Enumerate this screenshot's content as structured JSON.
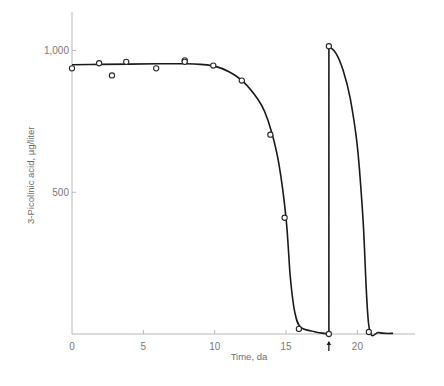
{
  "chart_data": {
    "type": "scatter",
    "title": "",
    "xlabel": "Time, da",
    "ylabel": "3-Picolinic acid, µg/liter",
    "xlim": [
      0,
      24
    ],
    "ylim": [
      0,
      1150
    ],
    "grid": false,
    "legend": null,
    "x_ticks": [
      0,
      5,
      10,
      15,
      20
    ],
    "x_tick_labels": [
      "0",
      "5",
      "10",
      "15",
      "20"
    ],
    "y_ticks": [
      500,
      1000
    ],
    "y_tick_labels": [
      "500",
      "1,000"
    ],
    "series": [
      {
        "name": "observed",
        "style": "open-circle",
        "x": [
          0,
          1.9,
          2.8,
          3.8,
          5.9,
          7.9,
          7.9,
          9.9,
          11.9,
          13.9,
          14.9,
          15.9,
          18.0,
          18.0,
          20.8
        ],
        "y": [
          937,
          955,
          912,
          960,
          937,
          965,
          960,
          947,
          894,
          703,
          410,
          18,
          0,
          1015,
          7
        ]
      },
      {
        "name": "fitted curve",
        "style": "line",
        "x": [
          0,
          2,
          4,
          6,
          8,
          9,
          10,
          11,
          12,
          13,
          13.5,
          14,
          14.5,
          15,
          15.3,
          15.6,
          16,
          17,
          18,
          18,
          18.5,
          19,
          19.5,
          20,
          20.4,
          20.8,
          21.5,
          22.5
        ],
        "y": [
          950,
          951,
          952,
          953,
          953,
          951,
          945,
          925,
          890,
          830,
          785,
          710,
          600,
          410,
          200,
          80,
          25,
          8,
          0,
          1015,
          990,
          930,
          830,
          660,
          400,
          30,
          5,
          2
        ]
      }
    ],
    "annotations": [
      {
        "type": "arrow-up",
        "x": 18,
        "label": "↑",
        "position": "below-x-axis"
      }
    ],
    "axis_labels": {
      "x": "Time, da",
      "y": "3-Picolinic acid, µg/liter"
    }
  }
}
